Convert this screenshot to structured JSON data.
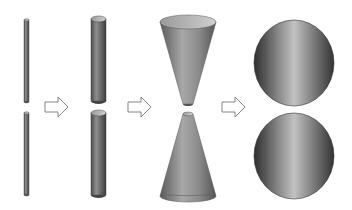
{
  "diagram": {
    "stages": [
      {
        "name": "thin-rods",
        "shape": "cylinder",
        "count": 2
      },
      {
        "name": "thick-cylinders",
        "shape": "cylinder",
        "count": 2
      },
      {
        "name": "cones",
        "shape": "cone",
        "count": 2
      },
      {
        "name": "spheres",
        "shape": "sphere",
        "count": 2
      }
    ],
    "arrows": 3,
    "colors": {
      "shape_dark": "#3a3a3a",
      "shape_mid": "#8a8a8a",
      "shape_light": "#c8c8c8",
      "arrow_stroke": "#777777",
      "background": "#ffffff"
    }
  }
}
